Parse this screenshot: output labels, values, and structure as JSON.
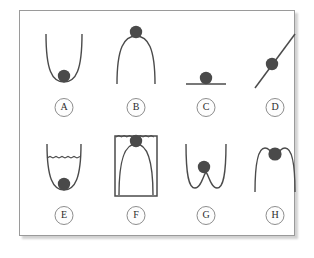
{
  "figure": {
    "background_color": "#ffffff",
    "frame_border_color": "#9a9a9a",
    "curve_color": "#4b4b4b",
    "ball_color": "#4a4a4a",
    "label_ring_color": "#8d8d8d",
    "panel_count": 8
  },
  "panels": [
    {
      "id": "a",
      "label": "A",
      "shape": "parabolic-well",
      "description": "Ball resting at the bottom of a U-shaped parabolic well",
      "ball_position": "bottom-center",
      "equilibrium": "stable"
    },
    {
      "id": "b",
      "label": "B",
      "shape": "inverted-parabola-hill",
      "description": "Ball balanced on the apex of an inverted parabola hill",
      "ball_position": "top-center",
      "equilibrium": "unstable"
    },
    {
      "id": "c",
      "label": "C",
      "shape": "flat-horizontal-line",
      "description": "Ball resting on a flat horizontal surface",
      "ball_position": "center-on-line",
      "equilibrium": "neutral"
    },
    {
      "id": "d",
      "label": "D",
      "shape": "inclined-line",
      "description": "Ball on a straight inclined plane rising to the right",
      "ball_position": "mid-slope",
      "equilibrium": "none"
    },
    {
      "id": "e",
      "label": "E",
      "shape": "parabolic-well-with-level-surface",
      "description": "Ball at the bottom of a U-shaped well with a wavy level line across the top",
      "ball_position": "bottom-center",
      "equilibrium": "stable"
    },
    {
      "id": "f",
      "label": "F",
      "shape": "box-with-dome",
      "description": "Rectangular box enclosing a dome, ball balanced on the dome apex at the wavy top line",
      "ball_position": "dome-apex",
      "equilibrium": "unstable"
    },
    {
      "id": "g",
      "label": "G",
      "shape": "double-well-w",
      "description": "W-shaped double well, ball on the central barrier",
      "ball_position": "central-barrier",
      "equilibrium": "metastable"
    },
    {
      "id": "h",
      "label": "H",
      "shape": "double-hump-m",
      "description": "M-shaped double hump with a shallow central dip, ball seated in the dip",
      "ball_position": "central-dip",
      "equilibrium": "metastable"
    }
  ]
}
